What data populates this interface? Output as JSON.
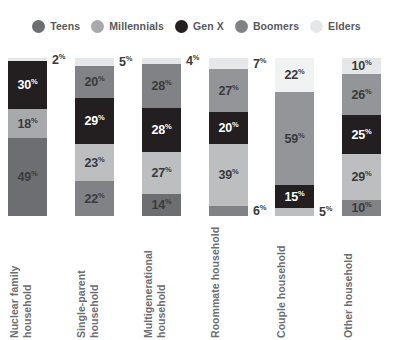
{
  "chart_data": {
    "type": "bar",
    "variant": "stacked-column",
    "title": "",
    "subtitle": "",
    "xlabel": "",
    "ylabel": "",
    "ylim": [
      0,
      100
    ],
    "grid": false,
    "legend_position": "top",
    "units": "%",
    "stack_order_top_to_bottom": [
      "Elders",
      "Millennials",
      "Gen X",
      "Boomers",
      "Teens"
    ],
    "categories": [
      "Nuclear family household",
      "Single-parent household",
      "Multigenerational household",
      "Roommate household",
      "Couple household",
      "Other household"
    ],
    "series": [
      {
        "name": "Teens",
        "color": "#6d6e71",
        "values": [
          49,
          22,
          14,
          6,
          5,
          10
        ]
      },
      {
        "name": "Millennials",
        "color": "#a7a9ac",
        "values": [
          18,
          23,
          27,
          39,
          22,
          29
        ]
      },
      {
        "name": "Gen X",
        "color": "#231f20",
        "values": [
          30,
          29,
          28,
          20,
          15,
          25
        ]
      },
      {
        "name": "Boomers",
        "color": "#808285",
        "values": [
          0,
          20,
          28,
          27,
          59,
          26
        ]
      },
      {
        "name": "Elders",
        "color": "#e6e7e8",
        "values": [
          2,
          5,
          4,
          7,
          0,
          10
        ]
      }
    ]
  },
  "legend": {
    "items": [
      {
        "label": "Teens",
        "color": "#6d6e71",
        "icon": "legend-dot-icon"
      },
      {
        "label": "Millennials",
        "color": "#a7a9ac",
        "icon": "legend-dot-icon"
      },
      {
        "label": "Gen X",
        "color": "#231f20",
        "icon": "legend-dot-icon"
      },
      {
        "label": "Boomers",
        "color": "#808285",
        "icon": "legend-dot-icon"
      },
      {
        "label": "Elders",
        "color": "#e6e7e8",
        "icon": "legend-dot-icon"
      }
    ]
  },
  "bars": [
    {
      "category": "Nuclear family household",
      "category_line1": "Nuclear family",
      "category_line2": "household",
      "segments": [
        {
          "series": "Elders",
          "value": 2,
          "label": "2",
          "color": "#e6e7e8",
          "text": "dark",
          "outside": true
        },
        {
          "series": "Gen X",
          "value": 30,
          "label": "30",
          "color": "#231f20",
          "text": "light",
          "outside": false
        },
        {
          "series": "Millennials",
          "value": 18,
          "label": "18",
          "color": "#a7a9ac",
          "text": "dark",
          "outside": false
        },
        {
          "series": "Teens",
          "value": 49,
          "label": "49",
          "color": "#6d6e71",
          "text": "dark",
          "outside": false
        }
      ]
    },
    {
      "category": "Single-parent household",
      "category_line1": "Single-parent",
      "category_line2": "household",
      "segments": [
        {
          "series": "Elders",
          "value": 5,
          "label": "5",
          "color": "#e6e7e8",
          "text": "dark",
          "outside": true
        },
        {
          "series": "Boomers",
          "value": 20,
          "label": "20",
          "color": "#808285",
          "text": "dark",
          "outside": false
        },
        {
          "series": "Gen X",
          "value": 29,
          "label": "29",
          "color": "#231f20",
          "text": "light",
          "outside": false
        },
        {
          "series": "Millennials",
          "value": 23,
          "label": "23",
          "color": "#bcbec0",
          "text": "dark",
          "outside": false
        },
        {
          "series": "Teens",
          "value": 22,
          "label": "22",
          "color": "#808285",
          "text": "dark",
          "outside": false
        }
      ]
    },
    {
      "category": "Multigenerational household",
      "category_line1": "Multigenerational",
      "category_line2": "household",
      "segments": [
        {
          "series": "Elders",
          "value": 4,
          "label": "4",
          "color": "#e6e7e8",
          "text": "dark",
          "outside": true
        },
        {
          "series": "Boomers",
          "value": 28,
          "label": "28",
          "color": "#808285",
          "text": "dark",
          "outside": false
        },
        {
          "series": "Gen X",
          "value": 28,
          "label": "28",
          "color": "#231f20",
          "text": "light",
          "outside": false
        },
        {
          "series": "Millennials",
          "value": 27,
          "label": "27",
          "color": "#bcbec0",
          "text": "dark",
          "outside": false
        },
        {
          "series": "Teens",
          "value": 14,
          "label": "14",
          "color": "#6d6e71",
          "text": "dark",
          "outside": false
        }
      ]
    },
    {
      "category": "Roommate household",
      "category_line1": "Roommate",
      "category_line2": "household",
      "segments": [
        {
          "series": "Elders",
          "value": 7,
          "label": "7",
          "color": "#e6e7e8",
          "text": "dark",
          "outside": true
        },
        {
          "series": "Boomers",
          "value": 27,
          "label": "27",
          "color": "#939598",
          "text": "dark",
          "outside": false
        },
        {
          "series": "Gen X",
          "value": 20,
          "label": "20",
          "color": "#231f20",
          "text": "light",
          "outside": false
        },
        {
          "series": "Millennials",
          "value": 39,
          "label": "39",
          "color": "#bcbec0",
          "text": "dark",
          "outside": false
        },
        {
          "series": "Teens",
          "value": 6,
          "label": "6",
          "color": "#808285",
          "text": "dark",
          "outside": true
        }
      ]
    },
    {
      "category": "Couple household",
      "category_line1": "Couple household",
      "category_line2": "",
      "segments": [
        {
          "series": "Elders",
          "value": 22,
          "label": "22",
          "color": "#f1f2f2",
          "text": "dark",
          "outside": false
        },
        {
          "series": "Boomers",
          "value": 59,
          "label": "59",
          "color": "#939598",
          "text": "dark",
          "outside": false
        },
        {
          "series": "Gen X",
          "value": 15,
          "label": "15",
          "color": "#231f20",
          "text": "light",
          "outside": false
        },
        {
          "series": "Teens",
          "value": 5,
          "label": "5",
          "color": "#bcbec0",
          "text": "dark",
          "outside": true
        }
      ]
    },
    {
      "category": "Other household",
      "category_line1": "Other household",
      "category_line2": "",
      "segments": [
        {
          "series": "Elders",
          "value": 10,
          "label": "10",
          "color": "#e6e7e8",
          "text": "dark",
          "outside": false
        },
        {
          "series": "Boomers",
          "value": 26,
          "label": "26",
          "color": "#939598",
          "text": "dark",
          "outside": false
        },
        {
          "series": "Gen X",
          "value": 25,
          "label": "25",
          "color": "#231f20",
          "text": "light",
          "outside": false
        },
        {
          "series": "Millennials",
          "value": 29,
          "label": "29",
          "color": "#bcbec0",
          "text": "dark",
          "outside": false
        },
        {
          "series": "Teens",
          "value": 10,
          "label": "10",
          "color": "#808285",
          "text": "dark",
          "outside": false
        }
      ]
    }
  ],
  "style": {
    "percent_symbol": "%",
    "background": "#ffffff",
    "label_color_dark": "#3a3a3c",
    "label_color_light": "#ffffff",
    "category_label_color": "#6d6e71",
    "legend_label_color": "#58595b"
  }
}
